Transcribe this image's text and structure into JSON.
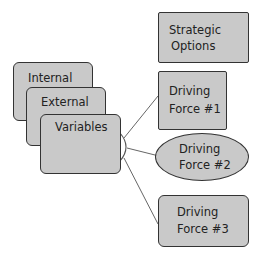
{
  "diagram": {
    "left_stack": [
      {
        "id": "internal",
        "label": "Internal"
      },
      {
        "id": "external",
        "label": "External"
      },
      {
        "id": "variables",
        "label": "Variables"
      }
    ],
    "right_nodes": [
      {
        "id": "strategic-options",
        "line1": "Strategic",
        "line2": "Options",
        "shape": "rectangle"
      },
      {
        "id": "driving-force-1",
        "line1": "Driving",
        "line2": "Force #1",
        "shape": "rectangle"
      },
      {
        "id": "driving-force-2",
        "line1": "Driving",
        "line2": "Force #2",
        "shape": "ellipse"
      },
      {
        "id": "driving-force-3",
        "line1": "Driving",
        "line2": "Force #3",
        "shape": "rectangle"
      }
    ],
    "edges": [
      {
        "from": "variables",
        "to": "driving-force-1"
      },
      {
        "from": "variables",
        "to": "driving-force-2"
      },
      {
        "from": "variables",
        "to": "driving-force-3"
      }
    ],
    "colors": {
      "node_fill": "#c9c9c9",
      "node_border": "#333333",
      "edge": "#666666",
      "background": "#ffffff"
    }
  }
}
